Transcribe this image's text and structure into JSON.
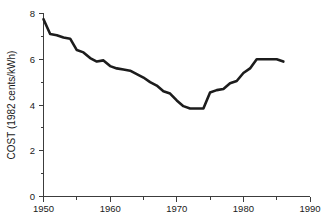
{
  "chart_data": {
    "type": "line",
    "title": "",
    "subtitle": "",
    "xlabel": "",
    "ylabel": "COST (1982 cents/kWh)",
    "xlim": [
      1950,
      1990
    ],
    "ylim": [
      0,
      8
    ],
    "grid": false,
    "legend": null,
    "x_ticks": [
      1950,
      1960,
      1970,
      1980,
      1990
    ],
    "x_tick_labels": [
      "1950",
      "1960",
      "1970",
      "1980",
      "1990"
    ],
    "x_minor_tick_interval": 5,
    "y_ticks": [
      0,
      2,
      4,
      6,
      8
    ],
    "y_tick_labels": [
      "0",
      "2",
      "4",
      "6",
      "8"
    ],
    "y_minor_tick_interval": 1,
    "series": [
      {
        "name": "Electricity cost",
        "color": "#1c1c1c",
        "x": [
          1950,
          1951,
          1952,
          1953,
          1954,
          1955,
          1956,
          1957,
          1958,
          1959,
          1960,
          1961,
          1962,
          1963,
          1964,
          1965,
          1966,
          1967,
          1968,
          1969,
          1970,
          1971,
          1972,
          1973,
          1974,
          1975,
          1976,
          1977,
          1978,
          1979,
          1980,
          1981,
          1982,
          1983,
          1984,
          1985,
          1986
        ],
        "values": [
          7.75,
          7.1,
          7.05,
          6.95,
          6.9,
          6.4,
          6.3,
          6.05,
          5.9,
          5.95,
          5.7,
          5.6,
          5.55,
          5.5,
          5.35,
          5.2,
          5.0,
          4.85,
          4.6,
          4.5,
          4.2,
          3.95,
          3.85,
          3.85,
          3.85,
          4.55,
          4.65,
          4.7,
          4.95,
          5.05,
          5.4,
          5.6,
          6.0,
          6.0,
          6.0,
          6.0,
          5.9
        ]
      }
    ]
  },
  "axes": {
    "y_axis_title": "COST (1982 cents/kWh)"
  }
}
